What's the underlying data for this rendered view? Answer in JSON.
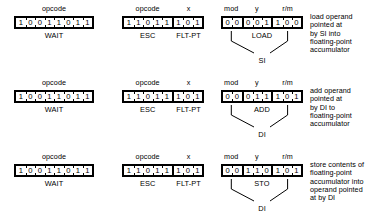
{
  "diagram": {
    "rows": [
      {
        "id": "load",
        "boxes": [
          {
            "id": "wait-opcode",
            "fields": [
              {
                "name": "opcode",
                "label": "opcode",
                "bits": [
                  "1",
                  "0",
                  "0",
                  "1",
                  "1",
                  "0",
                  "1",
                  "1"
                ]
              }
            ],
            "sub_labels": [
              {
                "name": "wait",
                "text": "WAIT"
              }
            ]
          },
          {
            "id": "esc-opcode",
            "fields": [
              {
                "name": "opcode",
                "label": "opcode",
                "bits": [
                  "1",
                  "1",
                  "0",
                  "1",
                  "1"
                ]
              },
              {
                "name": "x",
                "label": "x",
                "bits": [
                  "1",
                  "0",
                  "1"
                ]
              }
            ],
            "sub_labels": [
              {
                "name": "esc",
                "text": "ESC"
              },
              {
                "name": "flt-pt",
                "text": "FLT-PT"
              }
            ]
          },
          {
            "id": "modrm",
            "fields": [
              {
                "name": "mod",
                "label": "mod",
                "bits": [
                  "0",
                  "0"
                ]
              },
              {
                "name": "y",
                "label": "y",
                "bits": [
                  "0",
                  "0",
                  "1"
                ]
              },
              {
                "name": "rm",
                "label": "r/m",
                "bits": [
                  "1",
                  "0",
                  "0"
                ]
              }
            ],
            "sub_labels": [
              {
                "name": "operation",
                "text": "LOAD"
              }
            ],
            "register": "SI"
          }
        ],
        "description": "load operand\npointed at\nby SI into\nfloating-point\naccumulator"
      },
      {
        "id": "add",
        "boxes": [
          {
            "id": "wait-opcode",
            "fields": [
              {
                "name": "opcode",
                "label": "opcode",
                "bits": [
                  "1",
                  "0",
                  "0",
                  "1",
                  "1",
                  "0",
                  "1",
                  "1"
                ]
              }
            ],
            "sub_labels": [
              {
                "name": "wait",
                "text": "WAIT"
              }
            ]
          },
          {
            "id": "esc-opcode",
            "fields": [
              {
                "name": "opcode",
                "label": "opcode",
                "bits": [
                  "1",
                  "1",
                  "0",
                  "1",
                  "1"
                ]
              },
              {
                "name": "x",
                "label": "x",
                "bits": [
                  "1",
                  "0",
                  "1"
                ]
              }
            ],
            "sub_labels": [
              {
                "name": "esc",
                "text": "ESC"
              },
              {
                "name": "flt-pt",
                "text": "FLT-PT"
              }
            ]
          },
          {
            "id": "modrm",
            "fields": [
              {
                "name": "mod",
                "label": "mod",
                "bits": [
                  "0",
                  "0"
                ]
              },
              {
                "name": "y",
                "label": "y",
                "bits": [
                  "0",
                  "1",
                  "1"
                ]
              },
              {
                "name": "rm",
                "label": "r/m",
                "bits": [
                  "1",
                  "0",
                  "1"
                ]
              }
            ],
            "sub_labels": [
              {
                "name": "operation",
                "text": "ADD"
              }
            ],
            "register": "DI"
          }
        ],
        "description": "add operand\npointed at\nby DI to\nfloating-point\naccumulator"
      },
      {
        "id": "store",
        "boxes": [
          {
            "id": "wait-opcode",
            "fields": [
              {
                "name": "opcode",
                "label": "opcode",
                "bits": [
                  "1",
                  "0",
                  "0",
                  "1",
                  "1",
                  "0",
                  "1",
                  "1"
                ]
              }
            ],
            "sub_labels": [
              {
                "name": "wait",
                "text": "WAIT"
              }
            ]
          },
          {
            "id": "esc-opcode",
            "fields": [
              {
                "name": "opcode",
                "label": "opcode",
                "bits": [
                  "1",
                  "1",
                  "0",
                  "1",
                  "1"
                ]
              },
              {
                "name": "x",
                "label": "x",
                "bits": [
                  "1",
                  "0",
                  "1"
                ]
              }
            ],
            "sub_labels": [
              {
                "name": "esc",
                "text": "ESC"
              },
              {
                "name": "flt-pt",
                "text": "FLT-PT"
              }
            ]
          },
          {
            "id": "modrm",
            "fields": [
              {
                "name": "mod",
                "label": "mod",
                "bits": [
                  "0",
                  "0"
                ]
              },
              {
                "name": "y",
                "label": "y",
                "bits": [
                  "1",
                  "1",
                  "0"
                ]
              },
              {
                "name": "rm",
                "label": "r/m",
                "bits": [
                  "1",
                  "0",
                  "1"
                ]
              }
            ],
            "sub_labels": [
              {
                "name": "operation",
                "text": "STO"
              }
            ],
            "register": "DI"
          }
        ],
        "description": "store contents of\nfloating-point\naccumulator into\noperand pointed\nat by DI"
      }
    ],
    "layout": {
      "row_tops": [
        4,
        78,
        152
      ],
      "box_left": [
        14,
        122,
        221
      ],
      "box_width": [
        80,
        82,
        82
      ],
      "desc_left": 310,
      "desc_top_offset": 9
    },
    "colors": {
      "ink": "#000000",
      "paper": "#ffffff"
    }
  }
}
